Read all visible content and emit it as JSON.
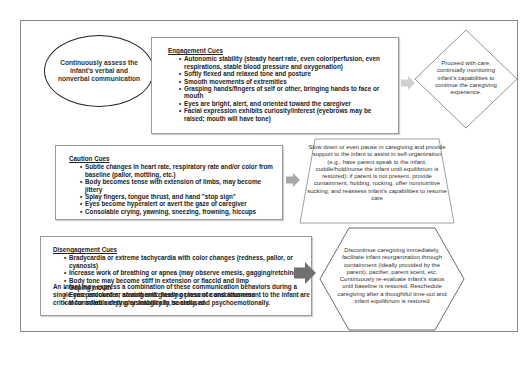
{
  "assess_ellipse": {
    "text": "Continuously assess the infant's verbal and nonverbal communication"
  },
  "engagement": {
    "title": "Engagement Cues",
    "items": [
      "Autonomic stability (steady heart rate, even color/perfusion, even respirations, stable blood pressure and oxygenation)",
      "Softly flexed and relaxed tone and posture",
      "Smooth movements of extremities",
      "Grasping hands/fingers of self or other, bringing hands to face or mouth",
      "Eyes are bright, alert, and oriented toward the caregiver",
      "Facial expression exhibits curiosity/interest (eyebrows may be raised; mouth will have tone)"
    ],
    "action_shape": "diamond",
    "action": "Proceed with care, continually monitoring infant's capabilities to continue the caregiving experience.",
    "arrow_color": "#c8c8c8"
  },
  "caution": {
    "title": "Caution Cues",
    "items": [
      "Subtle changes in heart rate, respiratory rate and/or color from baseline (pallor, mottling, etc.)",
      "Body becomes tense with extension of limbs, may become jittery",
      "Splay fingers, tongue thrust, and hand \"stop sign\"",
      "Eyes become hyperalert or avert the gaze of caregiver",
      "Consolable crying, yawning, sneezing, frowning, hiccups"
    ],
    "action_shape": "trapezoid",
    "action": "Slow down or even pause in caregiving and provide support to the infant to assist in self-organization (e.g., have parent speak to the infant, cuddle/hold/nurse the infant until equilibrium is restored); if parent is not present, provide containment, holding, rocking, offer nonnutritive sucking, and reassess infant's capabilities to resume care",
    "arrow_color": "#a8a8a8"
  },
  "disengagement": {
    "title": "Disengagement Cues",
    "items": [
      "Bradycardia or extreme tachycardia with color changes (redness, pallor, or cyanosis)",
      "Increase work of breathing or apnea (may observe emesis, gagging/retching)",
      "Body tone may become stiff in extension or flaccid and limp",
      "Gaping mouth",
      "Eyes panicked or staring and glassy or loss of consciousness",
      "Inconsolable crying or inability to be aroused"
    ],
    "action_shape": "hexagon",
    "action": "Discontinue caregiving immediately, facilitate infant reorganization through containment (ideally provided by the parent), pacifier, parent scent, etc. Continuously re-evaluate infant's status until baseline is restored. Reschedule caregiving after a thoughtful time-out and infant equilibrium is restored",
    "arrow_color": "#6e6e6e"
  },
  "footer_note": "An infant may express a combination of these communication behaviors during a single care encounter; an authentic healing presence and attunement to the infant are critical for infant safety physiologically, socially, and psychoemotionally."
}
